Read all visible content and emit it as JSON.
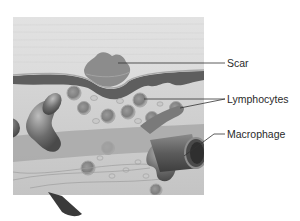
{
  "figure": {
    "style": "grayscale anatomical illustration"
  },
  "labels": [
    {
      "id": "scar",
      "text": "Scar"
    },
    {
      "id": "lymphocytes",
      "text": "Lymphocytes"
    },
    {
      "id": "macrophage",
      "text": "Macrophage"
    }
  ]
}
